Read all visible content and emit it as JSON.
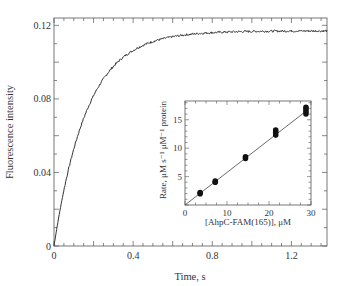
{
  "chart_data": [
    {
      "type": "line",
      "title": "",
      "xlabel": "Time, s",
      "ylabel": "Fluorescence intensity",
      "xlim": [
        0,
        1.38
      ],
      "ylim": [
        0,
        0.124
      ],
      "x_ticks": [
        "0",
        "0.4",
        "0.8",
        "1.2"
      ],
      "y_ticks": [
        "0",
        "0.04",
        "0.08",
        "0.12"
      ],
      "grid": false,
      "legend": null,
      "series": [
        {
          "name": "Fluorescence trace (data + single-exponential fit)",
          "model": "F = 0.117 * (1 - exp(-6 * t))",
          "x": [
            0,
            0.02,
            0.05,
            0.07,
            0.1,
            0.15,
            0.2,
            0.25,
            0.3,
            0.4,
            0.5,
            0.6,
            0.7,
            0.8,
            1.0,
            1.2,
            1.38
          ],
          "y": [
            0,
            0.013,
            0.03,
            0.04,
            0.053,
            0.069,
            0.082,
            0.091,
            0.097,
            0.106,
            0.112,
            0.114,
            0.116,
            0.117,
            0.117,
            0.117,
            0.117
          ]
        }
      ]
    },
    {
      "type": "scatter",
      "title": "inset",
      "xlabel": "[AhpC-FAM(165)], μM",
      "ylabel": "Rate, μM s⁻¹ μM⁻¹ protein",
      "xlim": [
        0,
        30
      ],
      "ylim": [
        0,
        18.3
      ],
      "x_ticks": [
        "0",
        "10",
        "20",
        "30"
      ],
      "y_ticks": [
        "5",
        "10",
        "15"
      ],
      "grid": false,
      "series": [
        {
          "name": "measured rates",
          "points": [
            [
              3.6,
              2.0
            ],
            [
              3.6,
              2.2
            ],
            [
              7.2,
              4.0
            ],
            [
              7.2,
              4.2
            ],
            [
              14.4,
              8.2
            ],
            [
              14.4,
              8.5
            ],
            [
              21.6,
              12.3
            ],
            [
              21.6,
              12.8
            ],
            [
              21.6,
              13.2
            ],
            [
              28.8,
              16.0
            ],
            [
              28.8,
              16.4
            ],
            [
              28.8,
              16.8
            ],
            [
              28.8,
              17.2
            ]
          ]
        },
        {
          "name": "linear fit",
          "type": "line",
          "x": [
            0,
            28.8
          ],
          "y": [
            0,
            16.5
          ]
        }
      ]
    }
  ],
  "labels": {
    "main_xlabel": "Time, s",
    "main_ylabel": "Fluorescence intensity",
    "main_x_ticks": [
      "0",
      "0.4",
      "0.8",
      "1.2"
    ],
    "main_y_ticks": [
      "0",
      "0.04",
      "0.08",
      "0.12"
    ],
    "inset_xlabel": "[AhpC-FAM(165)], μM",
    "inset_ylabel": "Rate, μM s⁻¹ μM⁻¹ protein",
    "inset_x_ticks": [
      "0",
      "10",
      "20",
      "30"
    ],
    "inset_y_ticks": [
      "5",
      "10",
      "15"
    ]
  },
  "colors": {
    "line": "#333333",
    "marker": "#111111",
    "frame": "#555555"
  }
}
